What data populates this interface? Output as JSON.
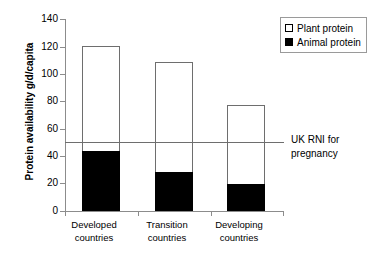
{
  "chart_data": {
    "type": "bar",
    "subtype": "stacked",
    "title": "",
    "xlabel": "",
    "ylabel": "Protein availability g/d/capita",
    "ylim": [
      0,
      140
    ],
    "yticks": [
      0,
      20,
      40,
      60,
      80,
      100,
      120,
      140
    ],
    "ytick_labels": [
      "0",
      "20",
      "40",
      "60",
      "80",
      "100",
      "120",
      "140"
    ],
    "grid": false,
    "legend_position": "top-right",
    "categories": [
      "Developed countries",
      "Transition countries",
      "Developing countries"
    ],
    "category_lines": [
      [
        "Developed",
        "countries"
      ],
      [
        "Transition",
        "countries"
      ],
      [
        "Developing",
        "countries"
      ]
    ],
    "series": [
      {
        "name": "Animal protein",
        "color": "#000000",
        "values": [
          44,
          28.5,
          20
        ]
      },
      {
        "name": "Plant protein",
        "color": "#ffffff",
        "values": [
          76,
          80,
          57
        ]
      }
    ],
    "totals": [
      120,
      108.5,
      77
    ],
    "annotations": [
      {
        "name": "uk-rni-reference-line",
        "value": 50,
        "label_lines": [
          "UK RNI for",
          "pregnancy"
        ],
        "label": "UK RNI for pregnancy",
        "color": "#6e6e6e"
      }
    ]
  },
  "legend": {
    "items": [
      {
        "label": "Plant protein",
        "swatch": "white-square"
      },
      {
        "label": "Animal protein",
        "swatch": "black-square"
      }
    ]
  },
  "colors": {
    "axis": "#8c8c8c",
    "bar_outline": "#6e6e6e",
    "animal_fill": "#000000",
    "plant_fill": "#ffffff",
    "reference_line": "#6e6e6e",
    "text": "#000000"
  }
}
